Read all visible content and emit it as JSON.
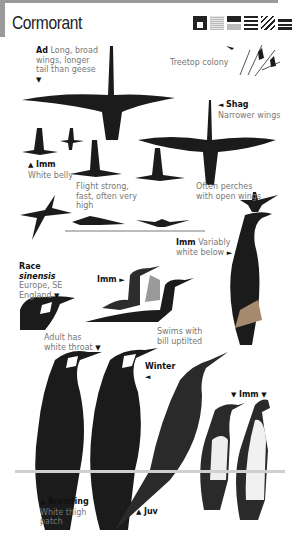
{
  "page": {
    "title": "Cormorant",
    "habitat_icons": [
      "house-icon",
      "grassland-icon",
      "river-icon",
      "lake-icon",
      "marsh-icon",
      "sea-icon"
    ]
  },
  "labels": {
    "adult": {
      "bold": "Ad",
      "text": "Long, broad wings, longer tail than geese",
      "arrow": "▼"
    },
    "treetop": {
      "text": "Treetop colony"
    },
    "shag": {
      "bold": "Shag",
      "text": "Narrower wings",
      "arrow": "◄"
    },
    "imm_flight": {
      "bold": "Imm",
      "text": "White belly",
      "arrow": "▲"
    },
    "flight": {
      "text": "Flight strong, fast, often very high"
    },
    "perches": {
      "text": "Often perches with open wings"
    },
    "imm_below": {
      "bold": "Imm",
      "text": "Variably white below",
      "arrow": "►"
    },
    "race": {
      "bold": "Race",
      "italic": "sinensis",
      "text": "Europe, SE England",
      "arrow": "▼"
    },
    "imm_swim": {
      "bold": "Imm",
      "arrow": "►"
    },
    "swims": {
      "text": "Swims with bill uptilted"
    },
    "throat": {
      "text": "Adult has white throat",
      "arrow": "▼"
    },
    "winter": {
      "bold": "Winter",
      "arrow": "◄"
    },
    "imm_standing": {
      "bold": "Imm",
      "arrow": "▼"
    },
    "breeding": {
      "bold": "Breeding",
      "text": "White thigh patch",
      "arrow": "▲"
    },
    "juv": {
      "bold": "Juv",
      "arrow": "▲"
    }
  }
}
